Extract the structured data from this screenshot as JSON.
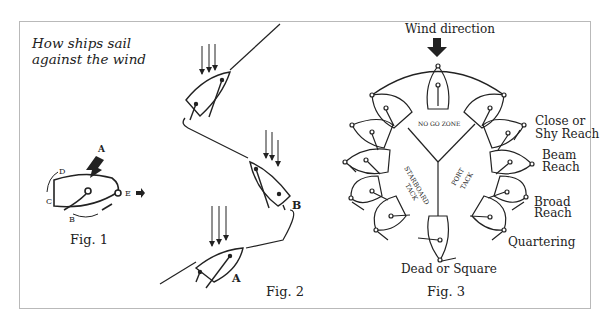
{
  "title": {
    "line1": "How ships sail",
    "line2": "against the wind"
  },
  "fig1": {
    "caption": "Fig. 1",
    "labels": {
      "a": "A",
      "b": "B",
      "c": "C",
      "d": "D",
      "e": "E"
    }
  },
  "fig2": {
    "caption": "Fig. 2",
    "labels": {
      "a": "A",
      "b": "B"
    }
  },
  "fig3": {
    "caption": "Fig. 3",
    "wind": "Wind direction",
    "no_go": "NO GO ZONE",
    "starboard": "STARBOARD",
    "starboard2": "TACK",
    "port": "PORT",
    "port2": "TACK",
    "points": [
      {
        "line1": "Close or",
        "line2": "Shy Reach"
      },
      {
        "line1": "Beam",
        "line2": "Reach"
      },
      {
        "line1": "Broad",
        "line2": "Reach"
      },
      {
        "line1": "Quartering",
        "line2": ""
      }
    ],
    "dead": "Dead or Square"
  },
  "colors": {
    "ink": "#222222",
    "frame": "#b9b9b9",
    "background": "#ffffff"
  }
}
